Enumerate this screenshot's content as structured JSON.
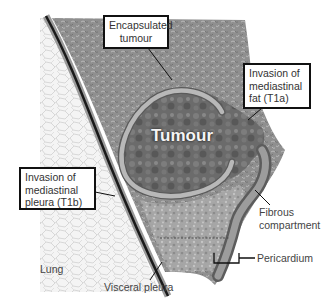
{
  "diagram": {
    "title_label": "Tumour",
    "labels": {
      "encapsulated": {
        "line1": "Encapsulated",
        "line2": "tumour"
      },
      "t1a": {
        "line1": "Invasion of",
        "line2": "mediastinal",
        "line3": "fat (T1a)"
      },
      "t1b": {
        "line1": "Invasion of",
        "line2": "mediastinal",
        "line3": "pleura (T1b)"
      },
      "fibrous": {
        "line1": "Fibrous",
        "line2": "compartment"
      },
      "pericardium": "Pericardium",
      "lung": "Lung",
      "visceral_pleura": "Visceral pleura"
    },
    "colors": {
      "background": "#ffffff",
      "lung_fill": "#f2f2f2",
      "lung_texture": "#bdbdbd",
      "mediastinal_fat": "#8e8e8e",
      "tumour": "#6a6a6a",
      "capsule": "#b4b4b4",
      "pleura_dark": "#1a1a1a",
      "pleura_light": "#9a9a9a",
      "pericardium": "#7a7a7a",
      "label_border": "#111111",
      "label_text": "#333333"
    }
  }
}
